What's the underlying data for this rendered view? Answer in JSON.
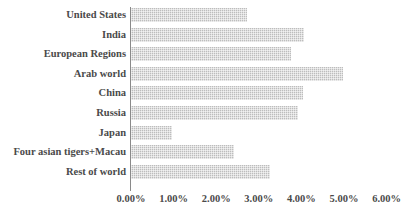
{
  "chart_data": {
    "type": "bar",
    "orientation": "horizontal",
    "title": "",
    "xlabel": "",
    "ylabel": "",
    "categories": [
      "United States",
      "India",
      "European Regions",
      "Arab world",
      "China",
      "Russia",
      "Japan",
      "Four asian tigers+Macau",
      "Rest of world"
    ],
    "values": [
      2.72,
      4.06,
      3.76,
      4.98,
      4.04,
      3.92,
      0.96,
      2.42,
      3.26
    ],
    "value_unit": "%",
    "xlim": [
      0,
      6
    ],
    "xticks": [
      0,
      1,
      2,
      3,
      4,
      5,
      6
    ],
    "xticklabels": [
      "0.00%",
      "1.00%",
      "2.00%",
      "3.00%",
      "4.00%",
      "5.00%",
      "6.00%"
    ],
    "grid": false,
    "legend": false,
    "bar_color": "#bdbdbd",
    "axis_color": "#8a8a8a",
    "text_color": "#4a4a4a"
  }
}
